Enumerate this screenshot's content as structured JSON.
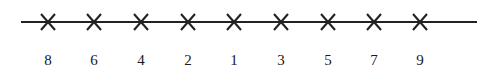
{
  "figure": {
    "name": "number-line-with-x-marks",
    "background_color": "#ffffff",
    "stroke_color": "#222222",
    "text_color": "#1a1a1a"
  },
  "axis": {
    "label": "horizontal-line",
    "x_start": 21,
    "x_end": 477,
    "y": 22,
    "thickness": 2
  },
  "marks": [
    {
      "glyph": "x-mark",
      "label": "8",
      "x": 48,
      "y": 22
    },
    {
      "glyph": "x-mark",
      "label": "6",
      "x": 94,
      "y": 22
    },
    {
      "glyph": "x-mark",
      "label": "4",
      "x": 141,
      "y": 22
    },
    {
      "glyph": "x-mark",
      "label": "2",
      "x": 188,
      "y": 22
    },
    {
      "glyph": "x-mark",
      "label": "1",
      "x": 234,
      "y": 22
    },
    {
      "glyph": "x-mark",
      "label": "3",
      "x": 281,
      "y": 22
    },
    {
      "glyph": "x-mark",
      "label": "5",
      "x": 328,
      "y": 22
    },
    {
      "glyph": "x-mark",
      "label": "7",
      "x": 374,
      "y": 22
    },
    {
      "glyph": "x-mark",
      "label": "9",
      "x": 420,
      "y": 22
    }
  ],
  "mark_size": {
    "half_width": 7,
    "half_height": 8
  },
  "chart_data": {
    "type": "scatter",
    "title": "",
    "xlabel": "",
    "ylabel": "",
    "categories": [
      "8",
      "6",
      "4",
      "2",
      "1",
      "3",
      "5",
      "7",
      "9"
    ],
    "values": [
      8,
      6,
      4,
      2,
      1,
      3,
      5,
      7,
      9
    ],
    "x": [
      48,
      94,
      141,
      188,
      234,
      281,
      328,
      374,
      420
    ],
    "tick_labels": [
      "8",
      "6",
      "4",
      "2",
      "1",
      "3",
      "5",
      "7",
      "9"
    ],
    "marker": "x",
    "grid": false,
    "legend": null,
    "annotations": []
  }
}
